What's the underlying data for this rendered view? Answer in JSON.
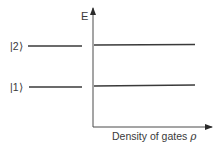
{
  "diagram": {
    "y_axis_label": "E",
    "x_axis_label": "Density of gates",
    "x_axis_symbol": "ρ",
    "levels": [
      {
        "label": "|2⟩",
        "y": 45
      },
      {
        "label": "|1⟩",
        "y": 86
      }
    ],
    "line_color": "#3a3a3a",
    "axis_color": "#4a4a4a"
  }
}
